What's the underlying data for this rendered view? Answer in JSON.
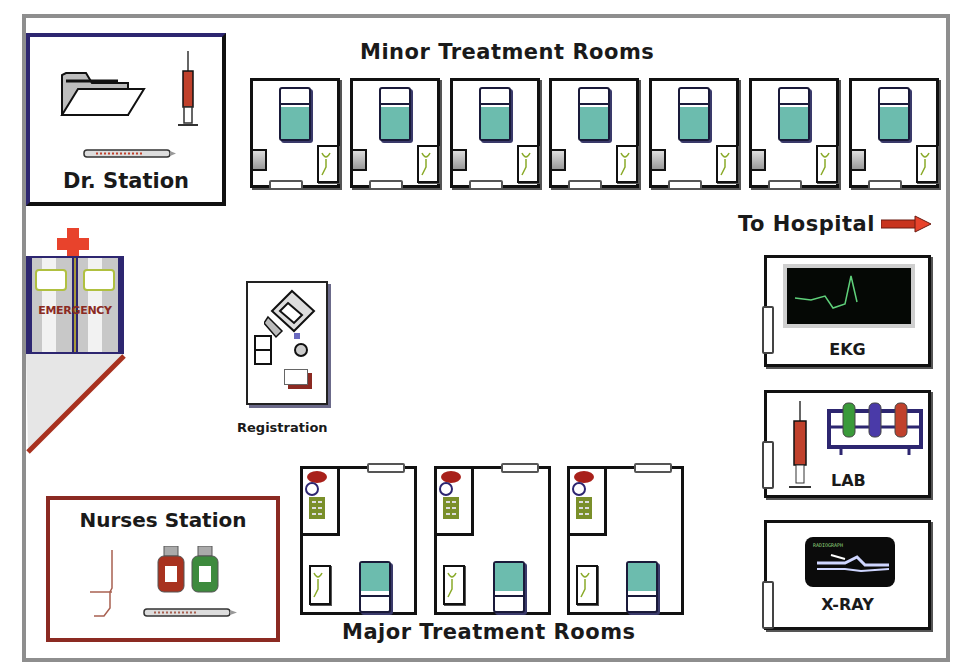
{
  "map": {
    "title_minor": "Minor Treatment Rooms",
    "title_major": "Major Treatment Rooms",
    "to_hospital": "To Hospital",
    "colors": {
      "frame": "#8e8e8e",
      "dr_station_border": "#2d2670",
      "nurse_station_border": "#8b2a22",
      "bed_sheet": "#6cbcae",
      "cross": "#e8432c",
      "arrow": "#c8341e"
    }
  },
  "dr_station": {
    "label": "Dr. Station",
    "icons": [
      "folder-icon",
      "syringe-icon",
      "thermometer-icon"
    ]
  },
  "emergency": {
    "label": "EMERGENCY",
    "icons": [
      "red-cross-icon",
      "double-door-icon",
      "ramp"
    ]
  },
  "registration": {
    "label": "Registration",
    "icons": [
      "computer-icon",
      "phone-icon",
      "paper-stack-icon"
    ]
  },
  "minor_rooms": [
    {
      "id": 1
    },
    {
      "id": 2
    },
    {
      "id": 3
    },
    {
      "id": 4
    },
    {
      "id": 5
    },
    {
      "id": 6
    },
    {
      "id": 7
    }
  ],
  "major_rooms": [
    {
      "id": 1
    },
    {
      "id": 2
    },
    {
      "id": 3
    }
  ],
  "nurses_station": {
    "label": "Nurses Station",
    "icons": [
      "iv-pole-icon",
      "red-bottle-icon",
      "green-bottle-icon",
      "thermometer-icon"
    ]
  },
  "ekg": {
    "label": "EKG"
  },
  "lab": {
    "label": "LAB"
  },
  "xray": {
    "label": "X-RAY",
    "film_caption": "RADIOGRAPH"
  }
}
